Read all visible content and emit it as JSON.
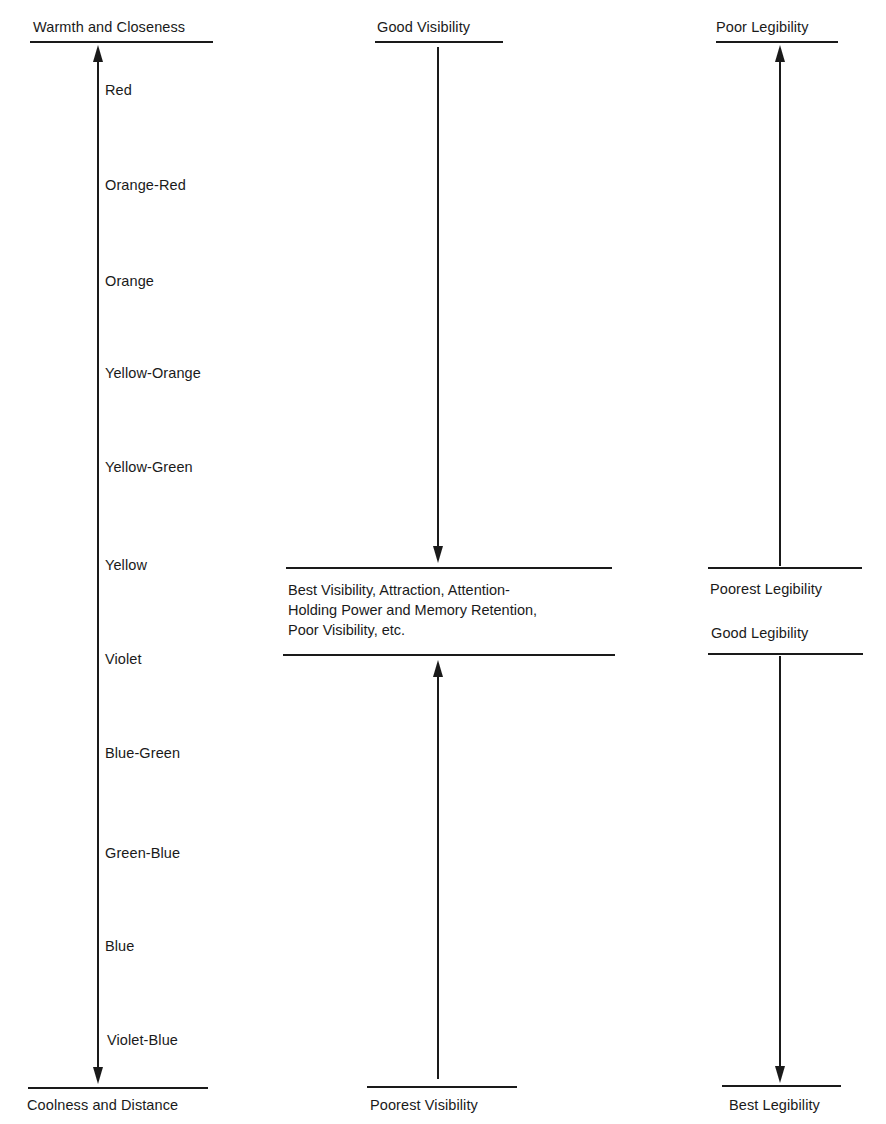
{
  "left_scale": {
    "top_label": "Warmth and Closeness",
    "bottom_label": "Coolness and Distance",
    "colors": [
      "Red",
      "Orange-Red",
      "Orange",
      "Yellow-Orange",
      "Yellow-Green",
      "Yellow",
      "Violet",
      "Blue-Green",
      "Green-Blue",
      "Blue",
      "Violet-Blue"
    ]
  },
  "middle_scale": {
    "top_label": "Good Visibility",
    "center_text": [
      "Best Visibility, Attraction, Attention-",
      "Holding Power and Memory Retention,",
      "Poor Visibility, etc."
    ],
    "bottom_label": "Poorest Visibility"
  },
  "right_scale": {
    "top_label": "Poor Legibility",
    "center_upper": "Poorest Legibility",
    "center_lower": "Good Legibility",
    "bottom_label": "Best Legibility"
  }
}
